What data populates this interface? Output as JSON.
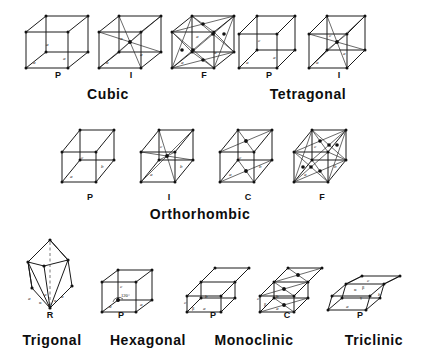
{
  "figure": {
    "background_color": "#ffffff",
    "line_color": "#1a1a1a"
  },
  "systems": [
    {
      "name": "Cubic",
      "label": "Cubic",
      "label_x": 70,
      "label_y": 86,
      "cells": [
        {
          "type": "P",
          "label": "P",
          "x": 22,
          "y": 14,
          "w": 70,
          "h": 58,
          "axes": [
            "a",
            "a",
            "a"
          ],
          "centering": "primitive"
        },
        {
          "type": "I",
          "label": "I",
          "x": 95,
          "y": 14,
          "w": 70,
          "h": 58,
          "axes": [
            "a",
            "a",
            "a"
          ],
          "centering": "body-centered"
        },
        {
          "type": "F",
          "label": "F",
          "x": 168,
          "y": 14,
          "w": 70,
          "h": 58,
          "axes": [
            "a",
            "a",
            "a"
          ],
          "centering": "face-centered"
        }
      ]
    },
    {
      "name": "Tetragonal",
      "label": "Tetragonal",
      "label_x": 258,
      "label_y": 86,
      "cells": [
        {
          "type": "P",
          "label": "P",
          "x": 235,
          "y": 14,
          "w": 66,
          "h": 58,
          "axes": [
            "a",
            "a",
            "c"
          ],
          "centering": "primitive"
        },
        {
          "type": "I",
          "label": "I",
          "x": 305,
          "y": 14,
          "w": 66,
          "h": 58,
          "axes": [
            "a",
            "a",
            "c"
          ],
          "centering": "body-centered"
        }
      ]
    },
    {
      "name": "Orthorhombic",
      "label": "Orthorhombic",
      "label_x": 125,
      "label_y": 208,
      "cells": [
        {
          "type": "P",
          "label": "P",
          "x": 58,
          "y": 126,
          "w": 62,
          "h": 58,
          "axes": [
            "a",
            "b",
            "c"
          ],
          "centering": "primitive"
        },
        {
          "type": "I",
          "label": "I",
          "x": 137,
          "y": 126,
          "w": 62,
          "h": 58,
          "axes": [
            "a",
            "b",
            "c"
          ],
          "centering": "body-centered"
        },
        {
          "type": "C",
          "label": "C",
          "x": 216,
          "y": 126,
          "w": 62,
          "h": 58,
          "axes": [
            "a",
            "b",
            "c"
          ],
          "centering": "base-centered"
        },
        {
          "type": "F",
          "label": "F",
          "x": 290,
          "y": 126,
          "w": 62,
          "h": 58,
          "axes": [
            "a",
            "b",
            "c"
          ],
          "centering": "face-centered"
        }
      ]
    },
    {
      "name": "Trigonal",
      "label": "Trigonal",
      "label_x": 8,
      "label_y": 336,
      "cells": [
        {
          "type": "R",
          "label": "R",
          "x": 18,
          "y": 240,
          "w": 60,
          "h": 80,
          "axes": [
            "a",
            "a",
            "a"
          ],
          "angles": [
            "α",
            "α",
            "α"
          ],
          "centering": "rhombohedral"
        }
      ]
    },
    {
      "name": "Hexagonal",
      "label": "Hexagonal",
      "label_x": 92,
      "label_y": 336,
      "cells": [
        {
          "type": "P",
          "label": "P",
          "x": 100,
          "y": 268,
          "w": 62,
          "h": 52,
          "axes": [
            "a",
            "a",
            "c"
          ],
          "angles": [
            "120°"
          ],
          "centering": "primitive"
        }
      ]
    },
    {
      "name": "Monoclinic",
      "label": "Monoclinic",
      "label_x": 193,
      "label_y": 336,
      "cells": [
        {
          "type": "P",
          "label": "P",
          "x": 183,
          "y": 268,
          "w": 66,
          "h": 52,
          "axes": [
            "a",
            "b",
            "c"
          ],
          "angles": [
            "β"
          ],
          "centering": "primitive"
        },
        {
          "type": "C",
          "label": "C",
          "x": 258,
          "y": 268,
          "w": 66,
          "h": 52,
          "axes": [
            "a",
            "b",
            "c"
          ],
          "angles": [
            "β"
          ],
          "centering": "base-centered"
        }
      ]
    },
    {
      "name": "Triclinic",
      "label": "Triclinic",
      "label_x": 330,
      "label_y": 336,
      "cells": [
        {
          "type": "P",
          "label": "P",
          "x": 328,
          "y": 276,
          "w": 70,
          "h": 48,
          "axes": [
            "a",
            "b",
            "c"
          ],
          "angles": [
            "α",
            "β",
            "γ"
          ],
          "centering": "primitive"
        }
      ]
    }
  ],
  "axis_labels": {
    "a": "a",
    "b": "b",
    "c": "c"
  },
  "angle_labels": {
    "alpha": "α",
    "beta": "β",
    "gamma": "γ",
    "hex": "120°"
  },
  "sublabels": {
    "cubic_p": "P",
    "cubic_i": "I",
    "cubic_f": "F",
    "tetragonal_p": "P",
    "tetragonal_i": "I",
    "ortho_p": "P",
    "ortho_i": "I",
    "ortho_c": "C",
    "ortho_f": "F",
    "trigonal_r": "R",
    "hexagonal_p": "P",
    "monoclinic_p": "P",
    "monoclinic_c": "C",
    "triclinic_p": "P"
  },
  "headings": {
    "cubic": "Cubic",
    "tetragonal": "Tetragonal",
    "orthorhombic": "Orthorhombic",
    "trigonal": "Trigonal",
    "hexagonal": "Hexagonal",
    "monoclinic": "Monoclinic",
    "triclinic": "Triclinic"
  }
}
